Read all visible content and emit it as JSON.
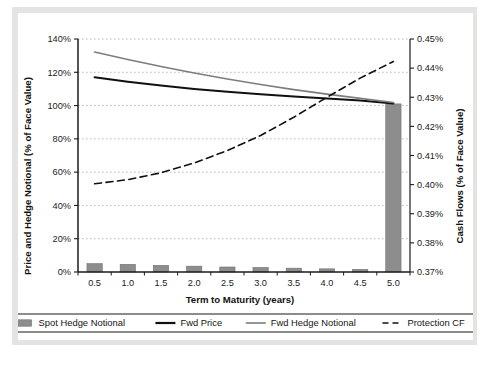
{
  "figure": {
    "background_color": "#ffffff",
    "page_frame_color": "#e4e4e2",
    "plot_border_color": "#1b1b1b",
    "gridline_color": "#9a9a9a"
  },
  "chart_data": {
    "type": "bar",
    "title": "",
    "subtitle": "",
    "xlabel": "Term to Maturity (years)",
    "ylabel": "Price and Hedge Notional (% of Face Value)",
    "y2label": "Cash Flows (% of Face Value)",
    "grid": true,
    "legend_position": "bottom",
    "x": [
      0.5,
      1.0,
      1.5,
      2.0,
      2.5,
      3.0,
      3.5,
      4.0,
      4.5,
      5.0
    ],
    "xtick_labels": [
      "0.5",
      "1.0",
      "1.5",
      "2.0",
      "2.5",
      "3.0",
      "3.5",
      "4.0",
      "4.5",
      "5.0"
    ],
    "xlim": [
      0.25,
      5.25
    ],
    "ylim": [
      0,
      140
    ],
    "ytick_values": [
      0,
      20,
      40,
      60,
      80,
      100,
      120,
      140
    ],
    "ytick_labels": [
      "0%",
      "20%",
      "40%",
      "60%",
      "80%",
      "100%",
      "120%",
      "140%"
    ],
    "y2lim": [
      0.37,
      0.45
    ],
    "y2tick_values": [
      0.37,
      0.38,
      0.39,
      0.4,
      0.41,
      0.42,
      0.43,
      0.44,
      0.45
    ],
    "y2tick_labels": [
      "0.37%",
      "0.38%",
      "0.39%",
      "0.40%",
      "0.41%",
      "0.42%",
      "0.43%",
      "0.44%",
      "0.45%"
    ],
    "series": [
      {
        "name": "Spot Hedge Notional",
        "type": "bar",
        "axis": "left",
        "color": "#8d8d8d",
        "edge_color": "#6f6f6f",
        "values": [
          5.0,
          4.6,
          4.0,
          3.5,
          3.0,
          2.7,
          2.3,
          1.9,
          1.6,
          101.0
        ]
      },
      {
        "name": "Fwd Price",
        "type": "line",
        "axis": "left",
        "color": "#111111",
        "line_width": 2.0,
        "dash": "solid",
        "values": [
          117.0,
          114.3,
          112.0,
          110.0,
          108.3,
          106.8,
          105.4,
          104.2,
          103.0,
          101.3
        ]
      },
      {
        "name": "Fwd Hedge Notional",
        "type": "line",
        "axis": "left",
        "color": "#7d7d7d",
        "line_width": 1.6,
        "dash": "solid",
        "values": [
          132.2,
          127.7,
          123.5,
          119.6,
          116.0,
          112.7,
          109.6,
          106.9,
          104.3,
          101.8
        ]
      },
      {
        "name": "Protection CF",
        "type": "line",
        "axis": "right",
        "color": "#111111",
        "line_width": 1.6,
        "dash": "dashed",
        "values": [
          0.4005,
          0.4018,
          0.4041,
          0.4075,
          0.4118,
          0.417,
          0.4232,
          0.43,
          0.4365,
          0.4422
        ],
        "values_left_scale": [
          53.0,
          55.5,
          59.6,
          65.5,
          73.0,
          82.0,
          93.0,
          105.0,
          116.5,
          126.5
        ]
      }
    ]
  },
  "legend": {
    "items": [
      {
        "label": "Spot Hedge Notional",
        "marker": "bar-swatch",
        "color": "#8d8d8d"
      },
      {
        "label": "Fwd Price",
        "marker": "solid-line-thick",
        "color": "#111111"
      },
      {
        "label": "Fwd Hedge Notional",
        "marker": "solid-line-thin",
        "color": "#7d7d7d"
      },
      {
        "label": "Protection CF",
        "marker": "dashed-line",
        "color": "#111111"
      }
    ]
  }
}
